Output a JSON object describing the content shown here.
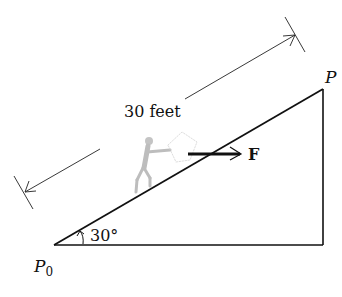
{
  "diagram": {
    "dimension_label": "30 feet",
    "angle_label": "30°",
    "force_label": "F",
    "point_start": {
      "main": "P",
      "sub": "0"
    },
    "point_end": "P"
  },
  "colors": {
    "line": "#111111",
    "figure": "#bdbdbd",
    "background": "#ffffff"
  }
}
